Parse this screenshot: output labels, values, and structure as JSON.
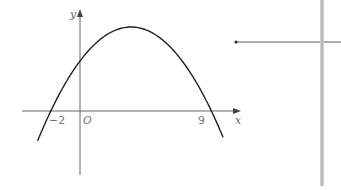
{
  "chart_data": {
    "type": "line",
    "title": "",
    "function": "quadratic (downward parabola)",
    "roots": [
      -2,
      9
    ],
    "vertex_x": 3.5,
    "xlabel": "x",
    "ylabel": "y",
    "origin_label": "O",
    "tick_labels": [
      "-2",
      "9"
    ],
    "x_range": [
      -3.9,
      11
    ],
    "curve_x_range": [
      -2.9,
      9.8
    ],
    "grid": false,
    "legend": "none"
  },
  "labels": {
    "x_axis": "x",
    "y_axis": "y",
    "origin": "O",
    "root_left": "−2",
    "root_right": "9"
  },
  "colors": {
    "curve": "#222222",
    "axes": "#555555",
    "divider": "#c8c8c8"
  }
}
